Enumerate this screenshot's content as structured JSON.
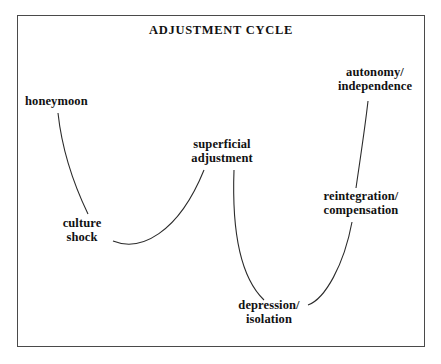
{
  "diagram": {
    "title": "ADJUSTMENT CYCLE",
    "frame": {
      "border_color": "#4a4a4a",
      "background": "#ffffff"
    },
    "line_color": "#2b2b2b",
    "text_color": "#111111",
    "nodes": [
      {
        "id": "honeymoon",
        "label": "honeymoon"
      },
      {
        "id": "culture-shock",
        "label": "culture\nshock"
      },
      {
        "id": "superficial-adjustment",
        "label": "superficial\nadjustment"
      },
      {
        "id": "depression-isolation",
        "label": "depression/\nisolation"
      },
      {
        "id": "reintegration-compensation",
        "label": "reintegration/\ncompensation"
      },
      {
        "id": "autonomy-independence",
        "label": "autonomy/\nindependence"
      }
    ],
    "connections": [
      {
        "from": "honeymoon",
        "to": "culture-shock"
      },
      {
        "from": "culture-shock",
        "to": "superficial-adjustment"
      },
      {
        "from": "superficial-adjustment",
        "to": "depression-isolation"
      },
      {
        "from": "depression-isolation",
        "to": "reintegration-compensation"
      },
      {
        "from": "reintegration-compensation",
        "to": "autonomy-independence"
      }
    ]
  }
}
